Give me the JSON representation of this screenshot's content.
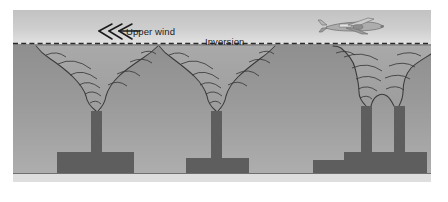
{
  "diagram": {
    "frame": {
      "x": 13,
      "y": 10,
      "width": 418,
      "height": 172
    },
    "colors": {
      "page_background": "#ffffff",
      "upper_band": "#cecece",
      "lower_band": "#9a9a9a",
      "ground_strip": "#dedede",
      "ground_line": "#6f6f6f",
      "inversion_line": "#2b2b2b",
      "structure": "#5e5e5e",
      "structure_outline": "#4a4a4a",
      "plume_fill": "#a5a5a5",
      "plume_outline": "#3a3a3a",
      "label_text": "#1b1b1b",
      "aircraft": "#8d8d8d"
    },
    "labels": {
      "upper_wind": "Upper wind",
      "inversion": "Inversion"
    },
    "wind": {
      "direction": "left",
      "chevron_count": 3,
      "icon": "wind-chevrons-icon"
    },
    "aircraft": {
      "icon": "airplane-icon",
      "heading": "right",
      "position": {
        "x": 322,
        "y": 12
      }
    },
    "inversion_layer": {
      "y": 33,
      "style": "dashed",
      "description": "Inversion lid trapping plumes below"
    },
    "ground": {
      "y": 163
    },
    "sources": [
      {
        "name": "left-single-stack",
        "type": "single-stack",
        "building": {
          "x": 44,
          "y": 142,
          "width": 77,
          "height": 21
        },
        "stacks": [
          {
            "x": 78,
            "y": 101,
            "width": 11,
            "height": 41
          }
        ],
        "plume": {
          "spread": "fanning-trapped",
          "top_half_width": 57
        }
      },
      {
        "name": "center-single-stack",
        "type": "single-stack",
        "building": {
          "x": 173,
          "y": 148,
          "width": 63,
          "height": 15
        },
        "stacks": [
          {
            "x": 198,
            "y": 101,
            "width": 11,
            "height": 47
          }
        ],
        "plume": {
          "spread": "fanning-trapped",
          "top_half_width": 52
        }
      },
      {
        "name": "right-double-stack",
        "type": "double-stack",
        "building_step_low": {
          "x": 300,
          "y": 150,
          "width": 40,
          "height": 13
        },
        "building_step_high": {
          "x": 331,
          "y": 142,
          "width": 83,
          "height": 21
        },
        "stacks": [
          {
            "x": 348,
            "y": 96,
            "width": 11,
            "height": 46
          },
          {
            "x": 381,
            "y": 96,
            "width": 11,
            "height": 46
          }
        ],
        "plume": {
          "spread": "fanning-trapped-merged",
          "top_half_width": 70
        }
      }
    ]
  }
}
